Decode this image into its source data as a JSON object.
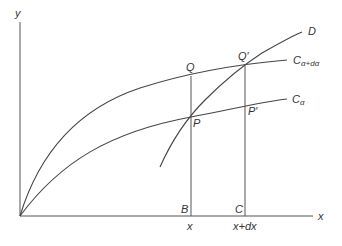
{
  "diagram": {
    "title": "",
    "axes": {
      "x_label": "x",
      "y_label": "y"
    },
    "curves": {
      "c_alpha_dalpha": {
        "label_main": "C",
        "label_sub": "α+dα"
      },
      "c_alpha": {
        "label_main": "C",
        "label_sub": "α"
      },
      "d": {
        "label": "D"
      }
    },
    "points": {
      "Q": "Q",
      "Q_prime": "Q′",
      "P": "P",
      "P_prime": "P′",
      "B": "B",
      "C": "C"
    },
    "x_ticks": {
      "x": "x",
      "x_plus_dx": "x+dx"
    },
    "colors": {
      "line": "#555555",
      "text": "#333333",
      "background": "#ffffff"
    }
  }
}
